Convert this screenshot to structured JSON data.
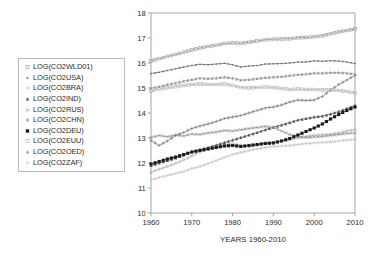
{
  "chart_data": {
    "type": "line",
    "title": "",
    "xlabel": "YEARS 1960-2010",
    "ylabel": "",
    "xlim": [
      1960,
      2010
    ],
    "ylim": [
      10,
      18
    ],
    "xticks": [
      "1960",
      "1970",
      "1980",
      "1990",
      "2000",
      "2010"
    ],
    "yticks": [
      "10",
      "11",
      "12",
      "13",
      "14",
      "15",
      "16",
      "17",
      "18"
    ],
    "grid": false,
    "legend_position": "left-outside",
    "x": [
      1960,
      1962,
      1964,
      1966,
      1968,
      1970,
      1972,
      1974,
      1976,
      1978,
      1980,
      1982,
      1984,
      1986,
      1988,
      1990,
      1992,
      1994,
      1996,
      1998,
      2000,
      2002,
      2004,
      2006,
      2008,
      2010
    ],
    "series": [
      {
        "name": "LOG(CO2WLD01)",
        "marker": "open-square",
        "color": "#9a9a9a",
        "values": [
          16.08,
          16.17,
          16.26,
          16.34,
          16.43,
          16.52,
          16.6,
          16.66,
          16.71,
          16.78,
          16.8,
          16.79,
          16.83,
          16.88,
          16.93,
          16.95,
          16.96,
          16.97,
          17.01,
          17.02,
          17.05,
          17.09,
          17.17,
          17.24,
          17.3,
          17.36
        ]
      },
      {
        "name": "LOG(CO2USA)",
        "marker": "dot",
        "color": "#6b6b6b",
        "values": [
          15.58,
          15.63,
          15.7,
          15.77,
          15.84,
          15.9,
          15.95,
          15.93,
          15.96,
          15.99,
          15.93,
          15.84,
          15.88,
          15.9,
          15.96,
          15.97,
          15.98,
          16.0,
          16.04,
          16.04,
          16.09,
          16.07,
          16.09,
          16.08,
          16.04,
          15.98
        ]
      },
      {
        "name": "LOG(CO2BRA)",
        "marker": "open-dot",
        "color": "#a8a8a8",
        "values": [
          11.62,
          11.75,
          11.86,
          11.98,
          12.12,
          12.28,
          12.44,
          12.57,
          12.66,
          12.74,
          12.76,
          12.72,
          12.66,
          12.73,
          12.8,
          12.84,
          12.88,
          12.93,
          13.0,
          13.06,
          13.11,
          13.13,
          13.15,
          13.2,
          13.28,
          13.34
        ]
      },
      {
        "name": "LOG(CO2IND)",
        "marker": "filled-triangle",
        "color": "#585858",
        "values": [
          11.9,
          12.0,
          12.1,
          12.2,
          12.32,
          12.45,
          12.54,
          12.62,
          12.72,
          12.82,
          12.92,
          13.02,
          13.12,
          13.22,
          13.33,
          13.43,
          13.52,
          13.62,
          13.72,
          13.78,
          13.84,
          13.88,
          13.96,
          14.06,
          14.18,
          14.3
        ]
      },
      {
        "name": "LOG(CO2RUS)",
        "marker": "cross-x",
        "color": "#8d8d8d",
        "values": [
          13.02,
          13.1,
          13.05,
          13.12,
          13.08,
          13.16,
          13.14,
          13.2,
          13.24,
          13.3,
          13.28,
          13.33,
          13.38,
          13.42,
          13.46,
          13.42,
          13.28,
          13.14,
          13.06,
          13.02,
          13.04,
          13.06,
          13.1,
          13.14,
          13.18,
          13.2
        ]
      },
      {
        "name": "LOG(CO2CHN)",
        "marker": "plus",
        "color": "#7d7d7d",
        "values": [
          12.9,
          12.7,
          12.88,
          13.1,
          13.22,
          13.38,
          13.48,
          13.56,
          13.66,
          13.78,
          13.84,
          13.9,
          14.0,
          14.1,
          14.2,
          14.24,
          14.32,
          14.44,
          14.52,
          14.5,
          14.52,
          14.66,
          14.92,
          15.14,
          15.32,
          15.5
        ]
      },
      {
        "name": "LOG(CO2DEU)",
        "marker": "filled-square",
        "color": "#1c1c1c",
        "values": [
          11.96,
          12.06,
          12.16,
          12.24,
          12.34,
          12.44,
          12.5,
          12.56,
          12.62,
          12.68,
          12.7,
          12.66,
          12.7,
          12.74,
          12.78,
          12.8,
          12.88,
          12.98,
          13.12,
          13.26,
          13.4,
          13.56,
          13.76,
          13.94,
          14.1,
          14.24
        ]
      },
      {
        "name": "LOG(CO2EUU)",
        "marker": "open-square-small",
        "color": "#b3b3b3",
        "values": [
          14.88,
          14.95,
          15.0,
          15.05,
          15.1,
          15.14,
          15.16,
          15.14,
          15.14,
          15.16,
          15.1,
          15.02,
          15.0,
          15.02,
          15.04,
          15.02,
          14.98,
          14.94,
          14.96,
          14.94,
          14.94,
          14.92,
          14.92,
          14.9,
          14.86,
          14.8
        ]
      },
      {
        "name": "LOG(CO2OED)",
        "marker": "small-triangle",
        "color": "#9e9e9e",
        "values": [
          15.0,
          15.06,
          15.14,
          15.2,
          15.28,
          15.34,
          15.4,
          15.38,
          15.4,
          15.44,
          15.4,
          15.32,
          15.34,
          15.38,
          15.42,
          15.44,
          15.46,
          15.5,
          15.54,
          15.56,
          15.6,
          15.6,
          15.62,
          15.62,
          15.6,
          15.56
        ]
      },
      {
        "name": "LOG(CO2ZAF)",
        "marker": "tiny-open",
        "color": "#bdbdbd",
        "values": [
          11.32,
          11.42,
          11.5,
          11.58,
          11.66,
          11.78,
          11.86,
          11.98,
          12.1,
          12.22,
          12.34,
          12.42,
          12.5,
          12.56,
          12.62,
          12.66,
          12.68,
          12.7,
          12.74,
          12.78,
          12.8,
          12.82,
          12.84,
          12.88,
          12.92,
          12.94
        ]
      }
    ]
  },
  "legend": {
    "items": [
      {
        "label": "LOG(CO2WLD01)",
        "marker": "open-square-icon"
      },
      {
        "label": "LOG(CO2USA)",
        "marker": "dot-icon"
      },
      {
        "label": "LOG(CO2BRA)",
        "marker": "open-dot-icon"
      },
      {
        "label": "LOG(CO2IND)",
        "marker": "filled-triangle-icon"
      },
      {
        "label": "LOG(CO2RUS)",
        "marker": "cross-x-icon"
      },
      {
        "label": "LOG(CO2CHN)",
        "marker": "plus-icon"
      },
      {
        "label": "LOG(CO2DEU)",
        "marker": "filled-square-icon"
      },
      {
        "label": "LOG(CO2EUU)",
        "marker": "open-square-small-icon"
      },
      {
        "label": "LOG(CO2OED)",
        "marker": "small-triangle-icon"
      },
      {
        "label": "LOG(CO2ZAF)",
        "marker": "tiny-open-icon"
      }
    ]
  },
  "axis": {
    "xlabel": "YEARS 1960-2010"
  },
  "colors": {
    "frame": "#9b9b9b",
    "text": "#2b2b2b",
    "background": "#ffffff"
  }
}
